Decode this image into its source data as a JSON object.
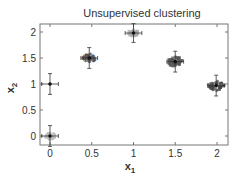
{
  "chart_data": {
    "type": "scatter",
    "title": "Unsupervised clustering",
    "xlabel": "x",
    "xlabel_sub": "1",
    "ylabel": "x",
    "ylabel_sub": "2",
    "xlim": [
      -0.12,
      2.15
    ],
    "ylim": [
      -0.12,
      2.1
    ],
    "xticks": [
      0,
      0.5,
      1,
      1.5,
      2
    ],
    "xtick_labels": [
      "0",
      "0.5",
      "1",
      "1.5",
      "2"
    ],
    "yticks": [
      0,
      0.5,
      1,
      1.5,
      2
    ],
    "ytick_labels": [
      "0",
      "0.5",
      "1",
      "1.5",
      "2"
    ],
    "grid": false,
    "legend": null,
    "clusters": [
      {
        "name": "cluster-1",
        "center": [
          0,
          0
        ],
        "x_err": 0.1,
        "y_err": 0.2,
        "spread": 0.06,
        "shade": "#bbbbbb",
        "marker": "light cloud"
      },
      {
        "name": "cluster-2",
        "center": [
          0,
          1
        ],
        "x_err": 0.1,
        "y_err": 0.2,
        "spread": 0.0,
        "shade": "#888888",
        "marker": "none"
      },
      {
        "name": "cluster-3",
        "center": [
          0.47,
          1.5
        ],
        "x_err": 0.1,
        "y_err": 0.2,
        "spread": 0.07,
        "shade": "#555555",
        "marker": "stars"
      },
      {
        "name": "cluster-4",
        "center": [
          1.0,
          1.98
        ],
        "x_err": 0.1,
        "y_err": 0.18,
        "spread": 0.06,
        "shade": "#aaaaaa",
        "marker": "light cloud"
      },
      {
        "name": "cluster-5",
        "center": [
          1.5,
          1.43
        ],
        "x_err": 0.1,
        "y_err": 0.2,
        "spread": 0.08,
        "shade": "#555555",
        "marker": "squares"
      },
      {
        "name": "cluster-6",
        "center": [
          1.99,
          0.97
        ],
        "x_err": 0.1,
        "y_err": 0.2,
        "spread": 0.09,
        "shade": "#444444",
        "marker": "dark cloud"
      }
    ]
  }
}
